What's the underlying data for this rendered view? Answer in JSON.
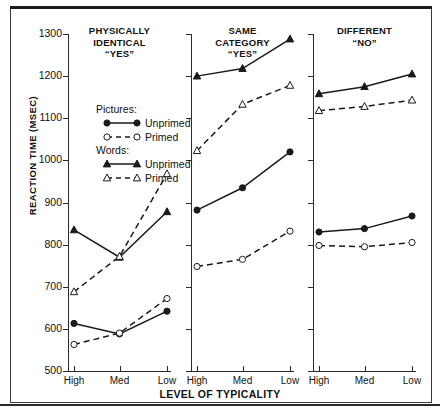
{
  "figure": {
    "y_axis_title": "REACTION TIME (MSEC)",
    "x_axis_title": "LEVEL OF TYPICALITY"
  },
  "legend": {
    "group1_heading": "Pictures:",
    "group1_items": [
      {
        "label": "Unprimed",
        "icon": "filled-circle-solid-line-icon"
      },
      {
        "label": "Primed",
        "icon": "open-circle-dashed-line-icon"
      }
    ],
    "group2_heading": "Words:",
    "group2_items": [
      {
        "label": "Unprimed",
        "icon": "filled-triangle-solid-line-icon"
      },
      {
        "label": "Primed",
        "icon": "open-triangle-dashed-line-icon"
      }
    ]
  },
  "y_ticks": [
    "1300",
    "1200",
    "1100",
    "1000",
    "900",
    "800",
    "700",
    "600",
    "500"
  ],
  "x_ticks": [
    "High",
    "Med",
    "Low"
  ],
  "panels": [
    {
      "title_lines": [
        "PHYSICALLY",
        "IDENTICAL",
        "“YES”"
      ]
    },
    {
      "title_lines": [
        "SAME",
        "CATEGORY",
        "“YES”"
      ]
    },
    {
      "title_lines": [
        "DIFFERENT",
        "“NO”"
      ]
    }
  ],
  "chart_data": {
    "type": "line",
    "title": "",
    "xlabel": "LEVEL OF TYPICALITY",
    "ylabel": "REACTION TIME (MSEC)",
    "ylim": [
      500,
      1300
    ],
    "ytick_step": 100,
    "grid": false,
    "legend_position": "inside-panel-1-upper",
    "categories": [
      "High",
      "Med",
      "Low"
    ],
    "panels": [
      {
        "name": "PHYSICALLY IDENTICAL “YES”",
        "series": [
          {
            "name": "Words: Unprimed",
            "marker": "filled-triangle",
            "line": "solid",
            "values": [
              835,
              770,
              878
            ]
          },
          {
            "name": "Words: Primed",
            "marker": "open-triangle",
            "line": "dashed",
            "values": [
              688,
              772,
              968
            ]
          },
          {
            "name": "Pictures: Unprimed",
            "marker": "filled-circle",
            "line": "solid",
            "values": [
              613,
              588,
              642
            ]
          },
          {
            "name": "Pictures: Primed",
            "marker": "open-circle",
            "line": "dashed",
            "values": [
              563,
              590,
              672
            ]
          }
        ]
      },
      {
        "name": "SAME CATEGORY “YES”",
        "series": [
          {
            "name": "Words: Unprimed",
            "marker": "filled-triangle",
            "line": "solid",
            "values": [
              1200,
              1218,
              1288
            ]
          },
          {
            "name": "Words: Primed",
            "marker": "open-triangle",
            "line": "dashed",
            "values": [
              1023,
              1133,
              1178
            ]
          },
          {
            "name": "Pictures: Unprimed",
            "marker": "filled-circle",
            "line": "solid",
            "values": [
              882,
              935,
              1020
            ]
          },
          {
            "name": "Pictures: Primed",
            "marker": "open-circle",
            "line": "dashed",
            "values": [
              748,
              765,
              832
            ]
          }
        ]
      },
      {
        "name": "DIFFERENT “NO”",
        "series": [
          {
            "name": "Words: Unprimed",
            "marker": "filled-triangle",
            "line": "solid",
            "values": [
              1158,
              1175,
              1205
            ]
          },
          {
            "name": "Words: Primed",
            "marker": "open-triangle",
            "line": "dashed",
            "values": [
              1118,
              1128,
              1143
            ]
          },
          {
            "name": "Pictures: Unprimed",
            "marker": "filled-circle",
            "line": "solid",
            "values": [
              830,
              838,
              868
            ]
          },
          {
            "name": "Pictures: Primed",
            "marker": "open-circle",
            "line": "dashed",
            "values": [
              798,
              795,
              805
            ]
          }
        ]
      }
    ]
  },
  "colors": {
    "ink": "#1a1a1a",
    "axis": "#2b2b2b",
    "background": "#ffffff"
  }
}
